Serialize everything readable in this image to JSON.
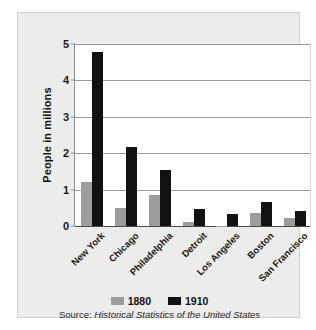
{
  "chart_data": {
    "type": "bar",
    "title": "",
    "xlabel": "",
    "ylabel": "People in millions",
    "ylim": [
      0,
      5
    ],
    "yticks": [
      0,
      1,
      2,
      3,
      4,
      5
    ],
    "ytick_labels": [
      "0",
      "1",
      "2",
      "3",
      "4",
      "5"
    ],
    "grid": true,
    "legend_position": "bottom",
    "categories": [
      "New York",
      "Chicago",
      "Philadelphia",
      "Detroit",
      "Los Angeles",
      "Boston",
      "San Francisco"
    ],
    "series": [
      {
        "name": "1880",
        "color": "#9d9d9d",
        "values": [
          1.2,
          0.5,
          0.85,
          0.12,
          0.01,
          0.36,
          0.23
        ]
      },
      {
        "name": "1910",
        "color": "#121212",
        "values": [
          4.77,
          2.18,
          1.55,
          0.47,
          0.32,
          0.67,
          0.42
        ]
      }
    ],
    "source_prefix": "Source: ",
    "source_title": "Historical Statistics of the United States"
  },
  "legend": {
    "items": [
      {
        "label": "1880"
      },
      {
        "label": "1910"
      }
    ]
  },
  "colors": {
    "series_1880": "#9d9d9d",
    "series_1910": "#121212",
    "card_background": "#ececeb",
    "plot_background": "#ffffff",
    "gridline": "#9a9a9a",
    "axis": "#4a4a4a"
  }
}
